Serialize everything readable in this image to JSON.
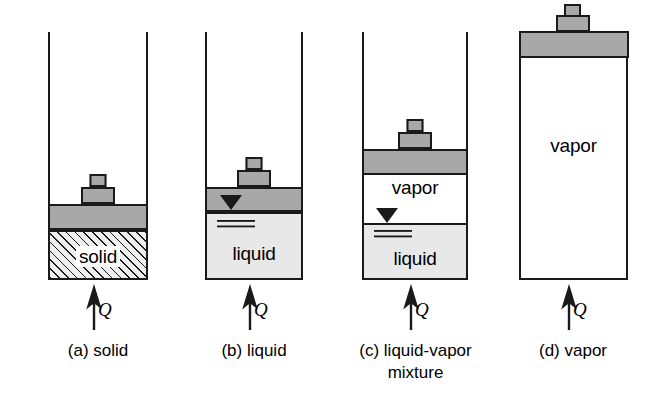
{
  "figure": {
    "background_color": "#ffffff",
    "outline_color": "#1a1a1a",
    "piston_color": "#a8a8a8",
    "liquid_color": "#e8e8e8",
    "solid_fill_color": "#efefef",
    "heat_symbol": "Q"
  },
  "panels": [
    {
      "id": "a",
      "caption": "(a) solid",
      "phase_label": "solid",
      "heat_symbol": "Q",
      "contents": [
        "solid"
      ]
    },
    {
      "id": "b",
      "caption": "(b) liquid",
      "phase_label": "liquid",
      "heat_symbol": "Q",
      "contents": [
        "liquid"
      ]
    },
    {
      "id": "c",
      "caption": "(c) liquid-vapor\nmixture",
      "phase_label_vapor": "vapor",
      "phase_label_liquid": "liquid",
      "heat_symbol": "Q",
      "contents": [
        "vapor",
        "liquid"
      ]
    },
    {
      "id": "d",
      "caption": "(d) vapor",
      "phase_label": "vapor",
      "heat_symbol": "Q",
      "contents": [
        "vapor"
      ]
    }
  ]
}
